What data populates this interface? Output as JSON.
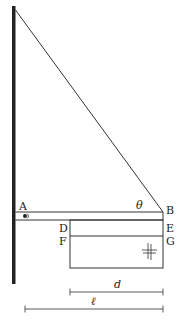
{
  "diagram": {
    "type": "physics-statics",
    "labels": {
      "A": "A",
      "B": "B",
      "D": "D",
      "E": "E",
      "F": "F",
      "G": "G",
      "theta": "θ",
      "d": "d",
      "l": "ℓ"
    },
    "colors": {
      "line": "#333333",
      "wall": "#222222",
      "background": "#ffffff"
    }
  }
}
